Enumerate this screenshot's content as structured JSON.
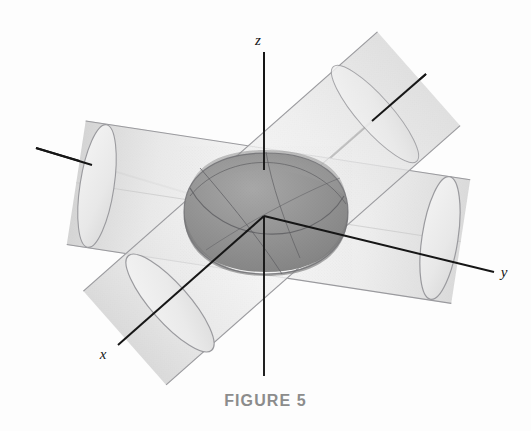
{
  "figure": {
    "caption": "FIGURE 5",
    "background_color": "#fdfdfd",
    "axis_line_color": "#161616",
    "outline_color": "#8e8e93",
    "cylinder_fill_light": "#f2f2f2",
    "cylinder_fill_mid": "#e4e4e4",
    "cylinder_fill_shadow": "#d6d6d6",
    "intersection_fill_dark": "#8a8a8a",
    "intersection_fill_mid": "#9e9e9e",
    "caption_color": "#8c8c8c"
  },
  "axes": [
    {
      "name": "x-axis",
      "label": "x",
      "label_x": 103,
      "label_y": 359,
      "positive_end": {
        "x": 118,
        "y": 345
      },
      "negative_end": {
        "x": 426,
        "y": 74
      },
      "origin": {
        "x": 264,
        "y": 216
      }
    },
    {
      "name": "y-axis",
      "label": "y",
      "label_x": 504,
      "label_y": 277,
      "positive_end": {
        "x": 494,
        "y": 272
      },
      "negative_end": {
        "x": 36,
        "y": 148
      },
      "origin": {
        "x": 264,
        "y": 216
      }
    },
    {
      "name": "z-axis",
      "label": "z",
      "label_x": 258,
      "label_y": 45,
      "positive_end": {
        "x": 264,
        "y": 52
      },
      "negative_end": {
        "x": 264,
        "y": 376
      },
      "origin": {
        "x": 264,
        "y": 216
      }
    }
  ],
  "solids": [
    {
      "name": "cylinder-along-x",
      "description": "Circular cylinder whose axis lies along the x-axis, running from lower-left to upper-right",
      "near_cap_center": {
        "x": 168,
        "y": 300
      },
      "far_cap_center": {
        "x": 374,
        "y": 118
      },
      "radius_px": 63
    },
    {
      "name": "cylinder-along-y",
      "description": "Circular cylinder whose axis lies along the y-axis, running from upper-left to lower-right",
      "near_cap_center": {
        "x": 438,
        "y": 238
      },
      "far_cap_center": {
        "x": 97,
        "y": 186
      },
      "radius_px": 62
    },
    {
      "name": "intersection-solid",
      "description": "Steinmetz solid formed where the two cylinders intersect, shaded dark gray at the origin",
      "center": {
        "x": 266,
        "y": 214
      },
      "half_width_px": 82,
      "half_height_px": 58
    }
  ]
}
